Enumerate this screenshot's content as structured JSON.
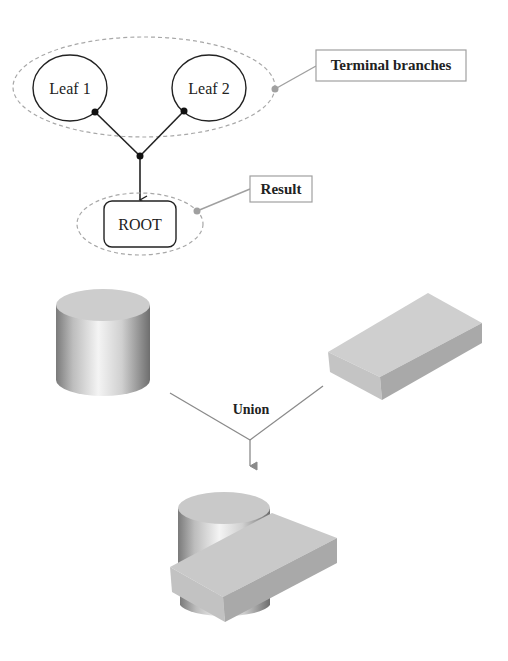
{
  "tree": {
    "leaves": [
      {
        "label": "Leaf 1",
        "cx": 70,
        "cy": 88
      },
      {
        "label": "Leaf 2",
        "cx": 209,
        "cy": 88
      }
    ],
    "root": {
      "label": "ROOT"
    },
    "callouts": {
      "terminal": "Terminal branches",
      "result": "Result"
    }
  },
  "operation": {
    "label": "Union",
    "operands": [
      "cylinder",
      "box"
    ],
    "result": "cylinder-union-box"
  },
  "colors": {
    "stroke": "#222222",
    "dashed": "#a8a8a8",
    "callout": "#a0a0a0",
    "box_top": "#cfcfcf",
    "box_front": "#c4c4c4",
    "box_side": "#a9a9a9"
  }
}
